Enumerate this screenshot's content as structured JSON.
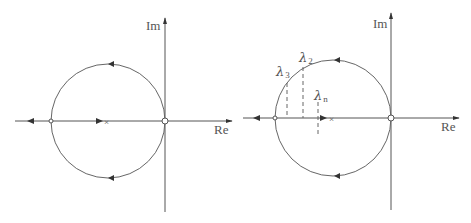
{
  "figures": [
    {
      "id": "left",
      "axes": {
        "real_label": "Re",
        "imag_label": "Im"
      },
      "markers": {
        "pole_symbol": "×"
      }
    },
    {
      "id": "right",
      "axes": {
        "real_label": "Re",
        "imag_label": "Im"
      },
      "markers": {
        "pole_symbol": "×"
      },
      "eigenvalue_labels": [
        {
          "symbol": "λ",
          "sub": "2"
        },
        {
          "symbol": "λ",
          "sub": "3"
        },
        {
          "symbol": "λ",
          "sub": "n"
        }
      ]
    }
  ]
}
